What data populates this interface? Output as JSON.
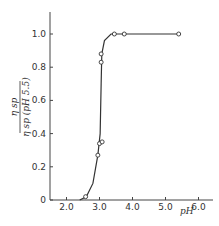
{
  "chart_data": {
    "type": "line",
    "title": "",
    "xlabel": "pH",
    "ylabel_numerator": "η sp",
    "ylabel_denominator": "η sp (pH 5.5)",
    "xlim": [
      1.5,
      6.5
    ],
    "ylim": [
      0,
      1.15
    ],
    "grid": false,
    "legend": null,
    "x_ticks": [
      "2.0",
      "3.0",
      "4.0",
      "5.0",
      "6.0"
    ],
    "y_ticks": [
      "0",
      "0.2",
      "0.4",
      "0.6",
      "0.8",
      "1.0"
    ],
    "series": [
      {
        "name": "measured",
        "style": "open-circle markers",
        "points": [
          {
            "x": 2.58,
            "y": 0.02
          },
          {
            "x": 2.95,
            "y": 0.27
          },
          {
            "x": 3.0,
            "y": 0.34
          },
          {
            "x": 3.08,
            "y": 0.35
          },
          {
            "x": 3.05,
            "y": 0.83
          },
          {
            "x": 3.05,
            "y": 0.88
          },
          {
            "x": 3.45,
            "y": 1.0
          },
          {
            "x": 3.75,
            "y": 1.0
          },
          {
            "x": 5.4,
            "y": 1.0
          }
        ]
      },
      {
        "name": "fitted curve",
        "style": "solid line",
        "points": [
          {
            "x": 2.4,
            "y": 0.0
          },
          {
            "x": 2.6,
            "y": 0.02
          },
          {
            "x": 2.8,
            "y": 0.1
          },
          {
            "x": 2.95,
            "y": 0.27
          },
          {
            "x": 3.02,
            "y": 0.4
          },
          {
            "x": 3.05,
            "y": 0.7
          },
          {
            "x": 3.07,
            "y": 0.88
          },
          {
            "x": 3.15,
            "y": 0.96
          },
          {
            "x": 3.35,
            "y": 1.0
          },
          {
            "x": 5.4,
            "y": 1.0
          }
        ]
      }
    ]
  }
}
